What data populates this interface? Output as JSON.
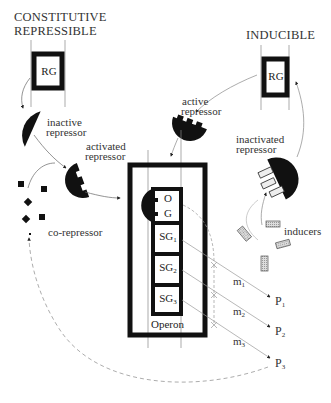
{
  "headings": {
    "left_line1": "CONSTITUTIVE",
    "left_line2": "REPRESSIBLE",
    "right": "INDUCIBLE"
  },
  "regulator_gene": {
    "left": "RG",
    "right": "RG"
  },
  "labels": {
    "inactive_repressor_1": "inactive",
    "inactive_repressor_2": "repressor",
    "active_repressor_1": "active",
    "active_repressor_2": "repressor",
    "activated_repressor_1": "activated",
    "activated_repressor_2": "repressor",
    "inactivated_repressor_1": "inactivated",
    "inactivated_repressor_2": "repressor",
    "co_repressor": "co-repressor",
    "inducers": "inducers"
  },
  "operon": {
    "title": "Operon",
    "operator": "O",
    "gene": "G",
    "structural_genes": [
      {
        "name": "SG",
        "sub": "1"
      },
      {
        "name": "SG",
        "sub": "2"
      },
      {
        "name": "SG",
        "sub": "3"
      }
    ]
  },
  "mrna": [
    {
      "name": "m",
      "sub": "1"
    },
    {
      "name": "m",
      "sub": "2"
    },
    {
      "name": "m",
      "sub": "3"
    }
  ],
  "proteins": [
    {
      "name": "P",
      "sub": "1"
    },
    {
      "name": "P",
      "sub": "2"
    },
    {
      "name": "P",
      "sub": "3"
    }
  ]
}
